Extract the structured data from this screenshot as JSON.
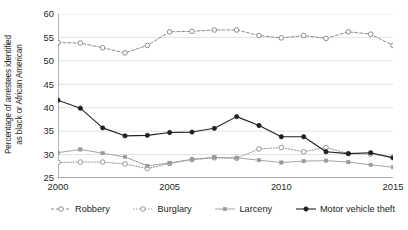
{
  "chart_data": {
    "type": "line",
    "title": "",
    "subtitle": "",
    "xlabel": "",
    "ylabel": "Percentage of arrestees identified as black or African American",
    "ylabel_lines": [
      "Percentage of arrestees identified",
      "as black or African American"
    ],
    "x": [
      2000,
      2001,
      2002,
      2003,
      2004,
      2005,
      2006,
      2007,
      2008,
      2009,
      2010,
      2011,
      2012,
      2013,
      2014,
      2015
    ],
    "xlim": [
      2000,
      2015
    ],
    "ylim": [
      25,
      60
    ],
    "yticks": [
      25,
      30,
      35,
      40,
      45,
      50,
      55,
      60
    ],
    "xticks": [
      2000,
      2005,
      2010,
      2015
    ],
    "xtick_labels": [
      "2000",
      "2005",
      "2010",
      "2015"
    ],
    "ytick_labels": [
      "25",
      "30",
      "35",
      "40",
      "45",
      "50",
      "55",
      "60"
    ],
    "grid": "horizontal",
    "legend_position": "bottom",
    "series": [
      {
        "name": "Robbery",
        "marker": "open-circle",
        "line_style": "dashed",
        "color": "#808080",
        "values": [
          53.9,
          53.8,
          52.8,
          51.7,
          53.3,
          56.2,
          56.3,
          56.6,
          56.6,
          55.4,
          54.9,
          55.4,
          54.8,
          56.2,
          55.7,
          53.3
        ]
      },
      {
        "name": "Burglary",
        "marker": "open-circle",
        "line_style": "dotted",
        "color": "#8c8c8c",
        "values": [
          28.3,
          28.4,
          28.4,
          28.0,
          27.0,
          28.1,
          28.9,
          29.3,
          29.2,
          31.2,
          31.5,
          30.6,
          31.5,
          30.2,
          30.1,
          29.5
        ]
      },
      {
        "name": "Larceny",
        "marker": "filled-square",
        "line_style": "solid",
        "color": "#9a9a9a",
        "values": [
          30.4,
          31.1,
          30.3,
          29.5,
          27.6,
          28.2,
          29.0,
          29.4,
          29.3,
          28.8,
          28.3,
          28.6,
          28.7,
          28.4,
          27.8,
          27.3
        ]
      },
      {
        "name": "Motor vehicle theft",
        "marker": "filled-circle",
        "line_style": "solid",
        "color": "#231f20",
        "values": [
          41.6,
          39.9,
          35.7,
          34.0,
          34.1,
          34.7,
          34.8,
          35.6,
          38.1,
          36.2,
          33.8,
          33.8,
          30.6,
          30.2,
          30.4,
          29.3
        ]
      }
    ]
  },
  "legend": {
    "items": [
      {
        "label": "Robbery"
      },
      {
        "label": "Burglary"
      },
      {
        "label": "Larceny"
      },
      {
        "label": "Motor vehicle theft"
      }
    ]
  },
  "colors": {
    "axis": "#58595b",
    "grid": "#d9d9d9",
    "text": "#231f20",
    "robbery": "#808080",
    "burglary": "#8c8c8c",
    "larceny": "#9a9a9a",
    "motor_vehicle_theft": "#231f20"
  }
}
